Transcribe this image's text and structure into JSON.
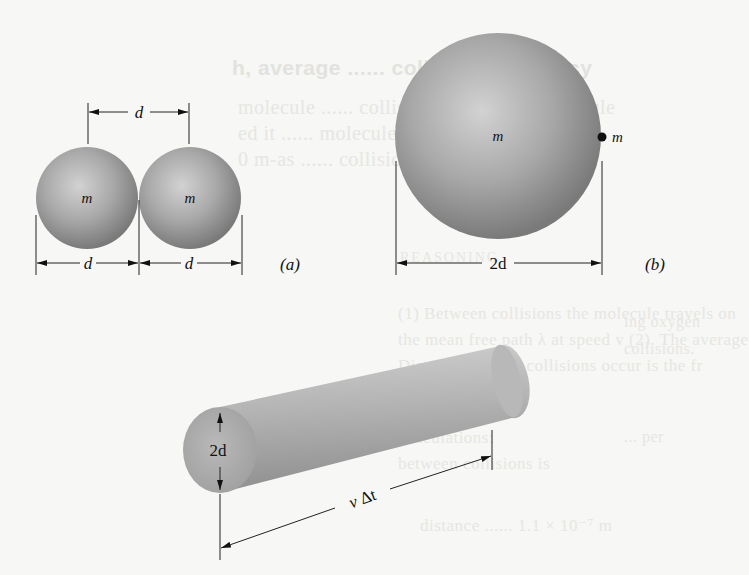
{
  "figure": {
    "panel_a": {
      "label": "(a)",
      "sphere_left_mass": "m",
      "sphere_right_mass": "m",
      "center_distance": "d",
      "left_diameter": "d",
      "right_diameter": "d"
    },
    "panel_b": {
      "label": "(b)",
      "large_sphere_mass": "m",
      "point_mass": "m",
      "diameter": "2d"
    },
    "cylinder": {
      "diameter": "2d",
      "length_v": "v",
      "length_delta": "Δt"
    }
  },
  "background_bleed": {
    "heading": "h, average ...... collision frequency",
    "line1": "molecule ...... collision for any gas molecule",
    "line2": "ed it ...... molecule collide that is with",
    "line3": "0 m-as ...... collisions",
    "section": "REASONING",
    "side1": "ing oxygen",
    "side2": "collisions.",
    "para1": "(1) Between collisions the molecule travels on",
    "para2": "the mean free path λ at speed v (2). The average",
    "para3": "Distance ...... the collisions occur is the fr",
    "para4": "the ......",
    "calc1": "Calculations:",
    "calc2": "between collisions is",
    "side3": "... per",
    "formula": "distance ...... 1.1 × 10⁻⁷ m"
  },
  "colors": {
    "sphere_light": "#c9c9c9",
    "sphere_dark": "#7f7f7f",
    "line": "#222222",
    "background": "#f7f7f5"
  }
}
